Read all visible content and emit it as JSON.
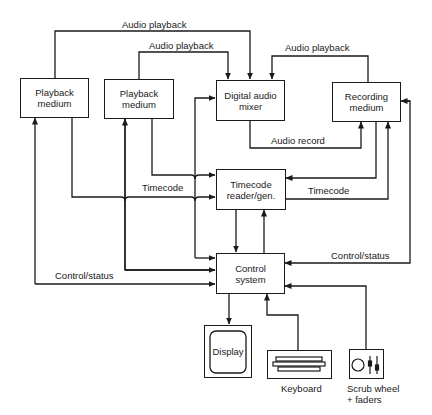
{
  "diagram": {
    "nodes": {
      "playback1": "Playback\nmedium",
      "playback2": "Playback\nmedium",
      "mixer": "Digital audio\nmixer",
      "recording": "Recording\nmedium",
      "timecode": "Timecode\nreader/gen.",
      "control": "Control\nsystem",
      "display": "Display",
      "keyboard": "Keyboard",
      "scrub": "Scrub wheel\n+ faders"
    },
    "edge_labels": {
      "audio_playback_1": "Audio playback",
      "audio_playback_2": "Audio playback",
      "audio_playback_3": "Audio playback",
      "audio_record": "Audio record",
      "timecode_left": "Timecode",
      "timecode_right": "Timecode",
      "control_status_left": "Control/status",
      "control_status_right": "Control/status"
    }
  }
}
